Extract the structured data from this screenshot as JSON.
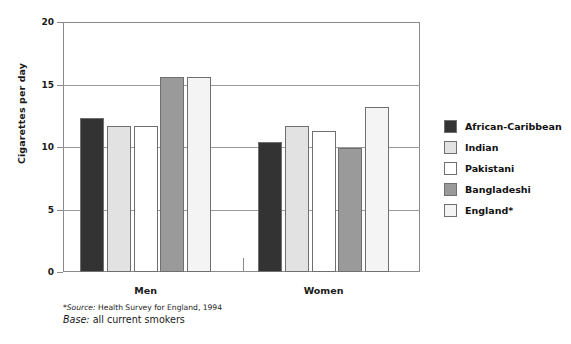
{
  "chart_data": {
    "type": "bar",
    "title": "",
    "xlabel": "",
    "ylabel": "Cigarettes per day",
    "ylim": [
      0,
      20
    ],
    "yticks": [
      0,
      5,
      10,
      15,
      20
    ],
    "ytick_labels": [
      "0",
      "5",
      "10",
      "15",
      "20"
    ],
    "grid": true,
    "legend_position": "right",
    "categories": [
      "Men",
      "Women"
    ],
    "series": [
      {
        "name": "African-Caribbean",
        "color": "#333333",
        "values": [
          12.3,
          10.4
        ]
      },
      {
        "name": "Indian",
        "color": "#e2e2e2",
        "values": [
          11.7,
          11.7
        ]
      },
      {
        "name": "Pakistani",
        "color": "#ffffff",
        "values": [
          11.7,
          11.3
        ]
      },
      {
        "name": "Bangladeshi",
        "color": "#9a9a9a",
        "values": [
          15.6,
          9.9
        ]
      },
      {
        "name": "England*",
        "color": "#f4f4f4",
        "values": [
          15.6,
          13.2
        ]
      }
    ]
  },
  "footnotes": {
    "source_marker": "*",
    "source_label": "Source:",
    "source_text": " Health Survey for England, 1994",
    "base_label": "Base:",
    "base_text": " all current smokers"
  }
}
